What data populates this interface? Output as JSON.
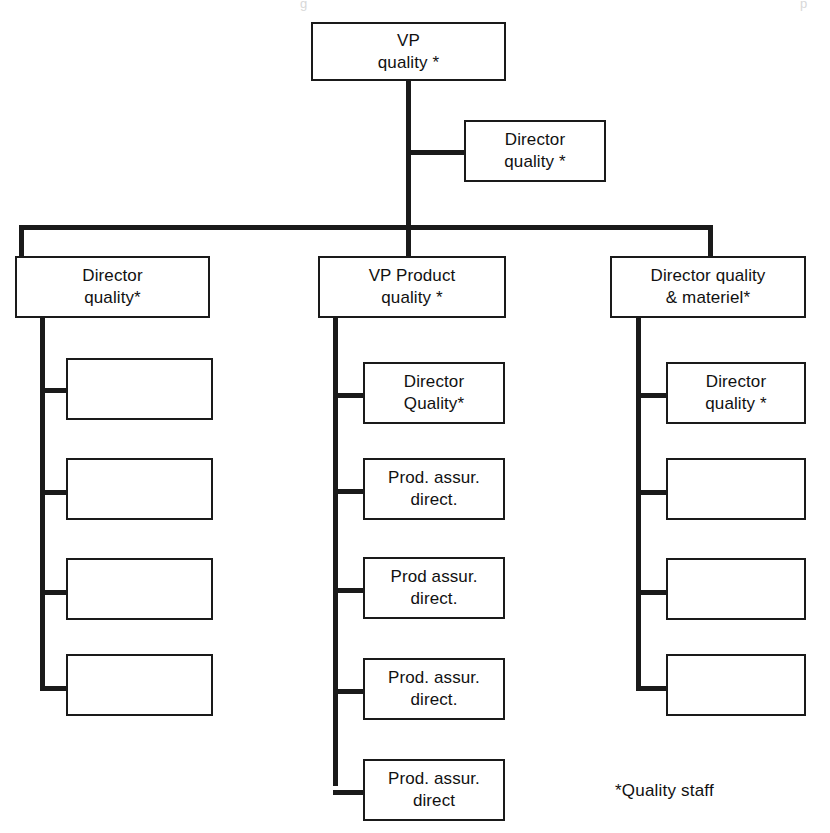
{
  "diagram": {
    "type": "organizational-chart",
    "footnote": "*Quality staff",
    "line_color": "#1a1a1a",
    "box_fill": "#ffffff"
  },
  "top": {
    "vp_quality": "VP\nquality *"
  },
  "staff": {
    "director_quality": "Director\nquality *"
  },
  "branches": {
    "left": {
      "header": "Director\nquality*",
      "children": [
        "",
        "",
        "",
        ""
      ]
    },
    "middle": {
      "header": "VP Product\nquality *",
      "children": [
        "Director\nQuality*",
        "Prod. assur.\ndirect.",
        "Prod assur.\ndirect.",
        "Prod. assur.\ndirect.",
        "Prod. assur.\ndirect"
      ]
    },
    "right": {
      "header": "Director quality\n& materiel*",
      "children": [
        "Director\nquality *",
        "",
        "",
        ""
      ]
    }
  },
  "bleed": {
    "left_fragment": "",
    "center_fragment": "g",
    "right_fragment": "p"
  }
}
